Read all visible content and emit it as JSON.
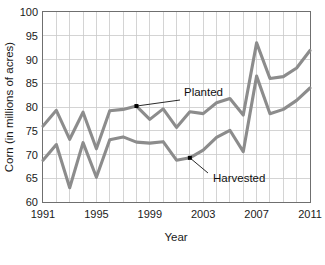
{
  "chart_data": {
    "type": "line",
    "title": "",
    "xlabel": "Year",
    "ylabel": "Corn (in millions of acres)",
    "xlim": [
      1991,
      2011
    ],
    "ylim": [
      60,
      100
    ],
    "ytick_labels": [
      "60",
      "65",
      "70",
      "75",
      "80",
      "85",
      "90",
      "95",
      "100"
    ],
    "ytick_values": [
      60,
      65,
      70,
      75,
      80,
      85,
      90,
      95,
      100
    ],
    "xtick_labels": [
      "1991",
      "1995",
      "1999",
      "2003",
      "2007",
      "2011"
    ],
    "xtick_values": [
      1991,
      1995,
      1999,
      2003,
      2007,
      2011
    ],
    "grid": true,
    "legend_position": "inline-annotation",
    "x": [
      1991,
      1992,
      1993,
      1994,
      1995,
      1996,
      1997,
      1998,
      1999,
      2000,
      2001,
      2002,
      2003,
      2004,
      2005,
      2006,
      2007,
      2008,
      2009,
      2010,
      2011
    ],
    "series": [
      {
        "name": "Planted",
        "color": "#8c8c8c",
        "values": [
          76.0,
          79.3,
          73.2,
          78.9,
          71.2,
          79.2,
          79.5,
          80.2,
          77.4,
          79.6,
          75.7,
          79.0,
          78.6,
          80.9,
          81.8,
          78.3,
          93.5,
          86.0,
          86.4,
          88.2,
          91.9
        ]
      },
      {
        "name": "Harvested",
        "color": "#8c8c8c",
        "values": [
          68.8,
          72.1,
          63.0,
          72.5,
          65.2,
          73.1,
          73.7,
          72.6,
          72.4,
          72.7,
          68.8,
          69.3,
          70.9,
          73.6,
          75.1,
          70.6,
          86.5,
          78.6,
          79.5,
          81.4,
          84.0
        ]
      }
    ],
    "annotations": [
      {
        "text": "Planted",
        "target_x": 1998,
        "target_y": 80.2,
        "label_x": 184,
        "label_y": 96
      },
      {
        "text": "Harvested",
        "target_x": 2002,
        "target_y": 69.3,
        "label_x": 213,
        "label_y": 182
      }
    ]
  }
}
